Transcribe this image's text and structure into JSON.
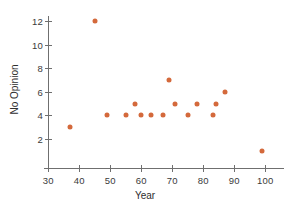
{
  "chart_data": {
    "type": "scatter",
    "title": "",
    "xlabel": "Year",
    "ylabel": "No Opinion",
    "xlim": [
      28,
      107
    ],
    "ylim": [
      0.4,
      12.8
    ],
    "xticks": [
      30,
      40,
      50,
      60,
      70,
      80,
      90,
      100
    ],
    "yticks": [
      2,
      4,
      6,
      8,
      10,
      12
    ],
    "grid": false,
    "legend": null,
    "marker_color": "#d4693b",
    "axis_color": "#6f6f6f",
    "points": [
      {
        "x": 37,
        "y": 3
      },
      {
        "x": 45,
        "y": 12
      },
      {
        "x": 49,
        "y": 4
      },
      {
        "x": 55,
        "y": 4
      },
      {
        "x": 58,
        "y": 5
      },
      {
        "x": 60,
        "y": 4
      },
      {
        "x": 63,
        "y": 4
      },
      {
        "x": 67,
        "y": 4
      },
      {
        "x": 69,
        "y": 7
      },
      {
        "x": 71,
        "y": 5
      },
      {
        "x": 75,
        "y": 4
      },
      {
        "x": 78,
        "y": 5
      },
      {
        "x": 83,
        "y": 4
      },
      {
        "x": 84,
        "y": 5
      },
      {
        "x": 87,
        "y": 6
      },
      {
        "x": 99,
        "y": 1
      }
    ]
  },
  "axes": {
    "x_title": "Year",
    "y_title": "No Opinion",
    "x_tick_labels": [
      "30",
      "40",
      "50",
      "60",
      "70",
      "80",
      "90",
      "100"
    ],
    "y_tick_labels": [
      "2",
      "4",
      "6",
      "8",
      "10",
      "12"
    ]
  }
}
